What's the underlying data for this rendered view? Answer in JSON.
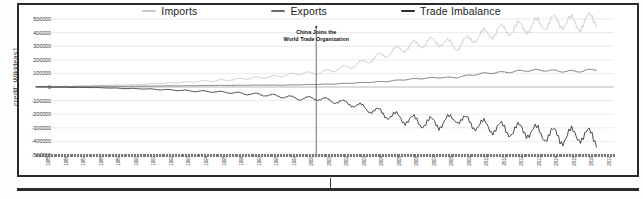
{
  "credit": {
    "text": "credit: Wikideas1"
  },
  "legend": {
    "position": "top-center",
    "items": [
      {
        "label": "Imports",
        "color": "#c8c8c8",
        "name": "imports"
      },
      {
        "label": "Exports",
        "color": "#6e6e6e",
        "name": "exports"
      },
      {
        "label": "Trade Imbalance",
        "color": "#2d2d2d",
        "name": "trade-imbalance"
      }
    ]
  },
  "annotation": {
    "line1": "China Joins the",
    "line2": "World Trade Organization",
    "at_year": 2001
  },
  "chart_data": {
    "type": "line",
    "title": "",
    "subtitle": "",
    "xlabel": "",
    "ylabel": "",
    "grid": true,
    "legend_position": "top-center",
    "ylim": [
      -500000,
      500000
    ],
    "yticks": [
      500000,
      400000,
      300000,
      200000,
      100000,
      0,
      -100000,
      -200000,
      -300000,
      -400000,
      -500000
    ],
    "ytick_labels": [
      "500000",
      "400000",
      "300000",
      "200000",
      "100000",
      "0",
      "-100000",
      "-200000",
      "-300000",
      "-400000",
      "-500000"
    ],
    "xlim": [
      1985,
      2018
    ],
    "x": [
      1985,
      1986,
      1987,
      1988,
      1989,
      1990,
      1991,
      1992,
      1993,
      1994,
      1995,
      1996,
      1997,
      1998,
      1999,
      2000,
      2001,
      2002,
      2003,
      2004,
      2005,
      2006,
      2007,
      2008,
      2009,
      2010,
      2011,
      2012,
      2013,
      2014,
      2015,
      2016,
      2017
    ],
    "xtick_labels": [
      "1985",
      "1986",
      "1987",
      "1988",
      "1989",
      "1990",
      "1991",
      "1992",
      "1993",
      "1994",
      "1995",
      "1996",
      "1997",
      "1998",
      "1999",
      "2000",
      "2001",
      "2002",
      "2003",
      "2004",
      "2005",
      "2006",
      "2007",
      "2008",
      "2009",
      "2010",
      "2011",
      "2012",
      "2013",
      "2014",
      "2015",
      "2016",
      "2017"
    ],
    "series": [
      {
        "name": "Imports",
        "color": "#c8c8c8",
        "values": [
          3862,
          4771,
          6294,
          8511,
          11990,
          15237,
          18969,
          25728,
          31540,
          38787,
          45543,
          51513,
          62558,
          71169,
          81788,
          100018,
          102278,
          125193,
          152436,
          196682,
          243470,
          287774,
          321443,
          337773,
          296374,
          364953,
          399335,
          425619,
          440434,
          468475,
          483202,
          462618,
          505470
        ]
      },
      {
        "name": "Exports",
        "color": "#6e6e6e",
        "values": [
          3856,
          3106,
          3497,
          5021,
          5755,
          4806,
          6278,
          7418,
          8763,
          9282,
          11754,
          11993,
          12862,
          14241,
          13111,
          16185,
          19182,
          22128,
          28368,
          34428,
          41192,
          53673,
          62937,
          69733,
          69497,
          91911,
          104121,
          110516,
          121721,
          123657,
          115873,
          115595,
          129894
        ]
      },
      {
        "name": "Trade Imbalance",
        "color": "#2d2d2d",
        "values": [
          -6,
          -1665,
          -2796,
          -3490,
          -6235,
          -10431,
          -12691,
          -18309,
          -22777,
          -29505,
          -33790,
          -39520,
          -49696,
          -56927,
          -68677,
          -83833,
          -83096,
          -103065,
          -124068,
          -162254,
          -202278,
          -234101,
          -258506,
          -268040,
          -226877,
          -273042,
          -295214,
          -315103,
          -318713,
          -344818,
          -367329,
          -347038,
          -375576
        ]
      }
    ]
  }
}
